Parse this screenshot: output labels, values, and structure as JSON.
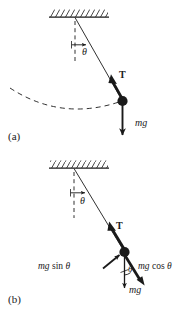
{
  "figure": {
    "type": "physics-free-body-diagram",
    "background_color": "#ffffff",
    "ink_color": "#1a1a1a"
  },
  "panel_a": {
    "tag": "(a)",
    "ceiling": {
      "name": "hatched-ceiling",
      "hatch_direction": "right-leaning"
    },
    "vertical_reference": {
      "style": "dashed",
      "name": "vertical-dashed-line"
    },
    "string": {
      "name": "pendulum-string",
      "style": "solid-thin"
    },
    "angle_label": "θ",
    "tension_label": "T",
    "weight_label": "mg",
    "arc": {
      "name": "swing-path-arc",
      "style": "dashed"
    },
    "bob": {
      "name": "pendulum-bob",
      "style": "filled-circle"
    }
  },
  "panel_b": {
    "tag": "(b)",
    "ceiling": {
      "name": "hatched-ceiling",
      "hatch_direction": "right-leaning"
    },
    "vertical_reference": {
      "style": "dashed",
      "name": "vertical-dashed-line"
    },
    "string": {
      "name": "pendulum-string",
      "style": "solid-thin"
    },
    "angle_label": "θ",
    "angle_label_at_bob": "θ",
    "tension_label": "T",
    "weight_label": "mg",
    "tangential_component": {
      "prefix": "mg",
      "func": "sin",
      "angle": "θ"
    },
    "radial_component": {
      "prefix": "mg",
      "func": "cos",
      "angle": "θ"
    },
    "bob": {
      "name": "pendulum-bob",
      "style": "filled-circle"
    }
  }
}
